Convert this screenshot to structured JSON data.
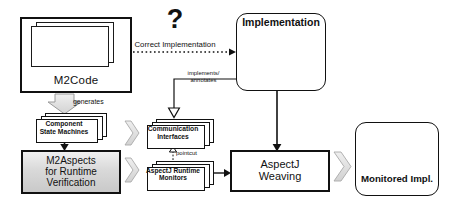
{
  "diagram": {
    "background": "#ffffff",
    "ink": "#111111",
    "fill_gray": "#d0d0d0",
    "arrow_gray": "#d8d8d8"
  },
  "nodes": {
    "m2code": {
      "label": "M2Code",
      "kind": "stacked-sequence-diagrams",
      "sheet_count": 3
    },
    "implementation": {
      "label": "Implementation",
      "kind": "rounded-box-with-cubes",
      "cube_count": 3
    },
    "component_state_machines": {
      "label": "Component\nState Machines",
      "kind": "stacked-document",
      "sheet_count": 3
    },
    "m2aspects": {
      "label": "M2Aspects\nfor Runtime\nVerification",
      "kind": "shaded-box"
    },
    "communication_interfaces": {
      "label": "Communication\nInterfaces",
      "kind": "stacked-document",
      "sheet_count": 3
    },
    "aspectj_runtime_monitors": {
      "label": "AspectJ Runtime\nMonitors",
      "kind": "stacked-document",
      "sheet_count": 3
    },
    "aspectj_weaving": {
      "label": "AspectJ\nWeaving",
      "kind": "hard-box"
    },
    "monitored_impl": {
      "label": "Monitored Impl.",
      "kind": "rounded-box-with-cubes-and-magnifier",
      "cube_count": 3
    }
  },
  "edges": {
    "correct_implementation": {
      "label": "Correct Implementation",
      "style": "dotted",
      "from": "m2code",
      "to": "implementation",
      "marker": "?"
    },
    "question_mark": {
      "glyph": "?"
    },
    "implements_annotates": {
      "label": "implements/\nannotates",
      "style": "solid-hollow-triangle",
      "from": "implementation",
      "to": "communication_interfaces"
    },
    "generates": {
      "label": "generates",
      "style": "block-arrow-down",
      "from": "m2code",
      "to": "component_state_machines"
    },
    "csm_to_m2aspects": {
      "label": "",
      "style": "solid-filled-arrow",
      "from": "component_state_machines",
      "to": "m2aspects"
    },
    "pointcut": {
      "label": "pointcut",
      "style": "dashed-hollow-triangle",
      "from": "aspectj_runtime_monitors",
      "to": "communication_interfaces"
    },
    "m2aspects_to_ci": {
      "style": "block-arrow-right",
      "from": "m2aspects",
      "to": "communication_interfaces"
    },
    "m2aspects_to_arm": {
      "style": "block-arrow-right",
      "from": "m2aspects",
      "to": "aspectj_runtime_monitors"
    },
    "arm_to_weaving": {
      "style": "solid-filled-arrow",
      "from": "aspectj_runtime_monitors",
      "to": "aspectj_weaving"
    },
    "impl_to_weaving": {
      "style": "solid-filled-arrow",
      "from": "implementation",
      "to": "aspectj_weaving"
    },
    "weaving_to_monitored": {
      "style": "block-arrow-right",
      "from": "aspectj_weaving",
      "to": "monitored_impl"
    }
  }
}
